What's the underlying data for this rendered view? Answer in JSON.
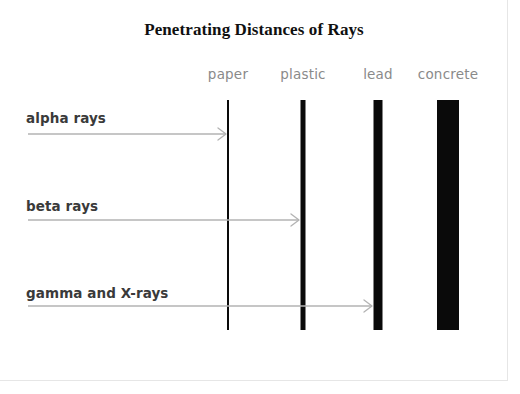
{
  "figure": {
    "title": "Penetrating Distances of Rays",
    "kind": "penetration-diagram",
    "canvas": {
      "width": 520,
      "height": 394
    },
    "colors": {
      "barrier": "#0a0a0a",
      "arrow": "#b3b3b3",
      "ray_label": "#3a3a3a",
      "barrier_label": "#8a8a8a",
      "title": "#101010",
      "background": "#ffffff",
      "frame": "#e6e6e6"
    }
  },
  "barriers": [
    {
      "id": "paper",
      "label": "paper",
      "x": 228,
      "thickness": 2,
      "top": 100,
      "height": 230
    },
    {
      "id": "plastic",
      "label": "plastic",
      "x": 303,
      "thickness": 5,
      "top": 100,
      "height": 230
    },
    {
      "id": "lead",
      "label": "lead",
      "x": 378,
      "thickness": 9,
      "top": 100,
      "height": 230
    },
    {
      "id": "concrete",
      "label": "concrete",
      "x": 448,
      "thickness": 22,
      "top": 100,
      "height": 230
    }
  ],
  "rays": [
    {
      "id": "alpha",
      "label": "alpha rays",
      "label_y": 110,
      "arrow_y": 134,
      "start_x": 28,
      "end_x": 226,
      "stopped_by": "paper",
      "penetrates": []
    },
    {
      "id": "beta",
      "label": "beta rays",
      "label_y": 198,
      "arrow_y": 220,
      "start_x": 28,
      "end_x": 299,
      "stopped_by": "plastic",
      "penetrates": [
        "paper"
      ]
    },
    {
      "id": "gamma",
      "label": "gamma and X-rays",
      "label_y": 285,
      "arrow_y": 306,
      "start_x": 28,
      "end_x": 372,
      "stopped_by": "lead",
      "penetrates": [
        "paper",
        "plastic"
      ]
    }
  ]
}
